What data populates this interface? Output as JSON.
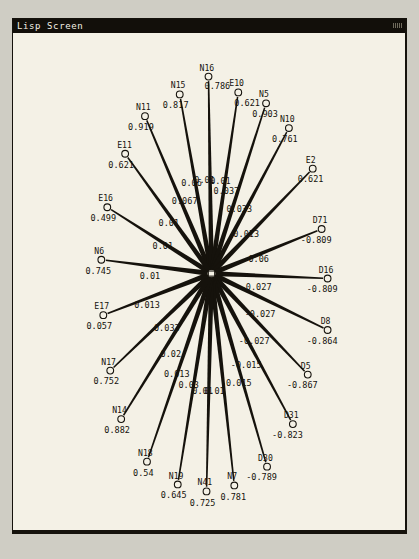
{
  "window": {
    "title": "Lisp Screen",
    "background_color": "#f4f1e6",
    "border_color": "#15120c",
    "desktop_color": "#cfcdc4"
  },
  "diagram": {
    "type": "radial-node-link-graph",
    "hub": {
      "name": "N13",
      "value": "0.89",
      "x": 213,
      "y": 276
    },
    "nodes": [
      {
        "name": "N11",
        "value": "0.919",
        "cx": 146,
        "cy": 117,
        "label_dx": -9,
        "label_dy": -6,
        "value_dx": -17,
        "value_dy": 14,
        "edge_label": "0.067",
        "edge_label_x": 186,
        "edge_label_y": 206
      },
      {
        "name": "N15",
        "value": "0.817",
        "cx": 181,
        "cy": 95,
        "label_dx": -9,
        "label_dy": -6,
        "value_dx": -17,
        "value_dy": 14,
        "edge_label": "0.06",
        "edge_label_x": 193,
        "edge_label_y": 188
      },
      {
        "name": "N16",
        "value": "0.786",
        "cx": 210,
        "cy": 77,
        "label_dx": -9,
        "label_dy": -6,
        "value_dx": -4,
        "value_dy": 13,
        "edge_label": "0.01",
        "edge_label_x": 206,
        "edge_label_y": 185
      },
      {
        "name": "E10",
        "value": "0.621",
        "cx": 240,
        "cy": 93,
        "label_dx": -9,
        "label_dy": -6,
        "value_dx": -4,
        "value_dy": 14,
        "edge_label": "0.01",
        "edge_label_x": 222,
        "edge_label_y": 186
      },
      {
        "name": "N5",
        "value": "0.903",
        "cx": 268,
        "cy": 104,
        "label_dx": -7,
        "label_dy": -6,
        "value_dx": -14,
        "value_dy": 14,
        "edge_label": "0.037",
        "edge_label_x": 228,
        "edge_label_y": 196
      },
      {
        "name": "N10",
        "value": "0.761",
        "cx": 291,
        "cy": 129,
        "label_dx": -9,
        "label_dy": -6,
        "value_dx": -17,
        "value_dy": 14,
        "edge_label": "0.033",
        "edge_label_x": 241,
        "edge_label_y": 214
      },
      {
        "name": "E2",
        "value": "0.621",
        "cx": 315,
        "cy": 170,
        "label_dx": -7,
        "label_dy": -6,
        "value_dx": -15,
        "value_dy": 14,
        "edge_label": "0.013",
        "edge_label_x": 248,
        "edge_label_y": 239
      },
      {
        "name": "D71",
        "value": "-0.809",
        "cx": 324,
        "cy": 231,
        "label_dx": -9,
        "label_dy": -6,
        "value_dx": -21,
        "value_dy": 14,
        "edge_label": "-0.06",
        "edge_label_x": 258,
        "edge_label_y": 264
      },
      {
        "name": "D16",
        "value": "-0.809",
        "cx": 330,
        "cy": 281,
        "label_dx": -9,
        "label_dy": -6,
        "value_dx": -21,
        "value_dy": 14,
        "edge_label": "-0.027",
        "edge_label_x": 258,
        "edge_label_y": 293
      },
      {
        "name": "D8",
        "value": "-0.864",
        "cx": 330,
        "cy": 333,
        "label_dx": -7,
        "label_dy": -6,
        "value_dx": -21,
        "value_dy": 14,
        "edge_label": "-0.027",
        "edge_label_x": 262,
        "edge_label_y": 320
      },
      {
        "name": "D5",
        "value": "-0.867",
        "cx": 310,
        "cy": 378,
        "label_dx": -7,
        "label_dy": -6,
        "value_dx": -21,
        "value_dy": 14,
        "edge_label": "-0.027",
        "edge_label_x": 256,
        "edge_label_y": 347
      },
      {
        "name": "D31",
        "value": "-0.823",
        "cx": 295,
        "cy": 428,
        "label_dx": -9,
        "label_dy": -6,
        "value_dx": -21,
        "value_dy": 14,
        "edge_label": "-0.015",
        "edge_label_x": 248,
        "edge_label_y": 371
      },
      {
        "name": "D30",
        "value": "-0.789",
        "cx": 269,
        "cy": 471,
        "label_dx": -9,
        "label_dy": -6,
        "value_dx": -21,
        "value_dy": 14,
        "edge_label": "-0.015",
        "edge_label_x": 238,
        "edge_label_y": 390
      },
      {
        "name": "N7",
        "value": "0.781",
        "cx": 236,
        "cy": 490,
        "label_dx": -7,
        "label_dy": -6,
        "value_dx": -14,
        "value_dy": 15,
        "edge_label": "0.01",
        "edge_label_x": 216,
        "edge_label_y": 398
      },
      {
        "name": "N41",
        "value": "0.725",
        "cx": 208,
        "cy": 496,
        "label_dx": -9,
        "label_dy": -6,
        "value_dx": -17,
        "value_dy": 15,
        "edge_label": "0.01",
        "edge_label_x": 204,
        "edge_label_y": 398
      },
      {
        "name": "N19",
        "value": "0.645",
        "cx": 179,
        "cy": 489,
        "label_dx": -9,
        "label_dy": -6,
        "value_dx": -17,
        "value_dy": 14,
        "edge_label": "0.03",
        "edge_label_x": 190,
        "edge_label_y": 392
      },
      {
        "name": "N18",
        "value": "0.54",
        "cx": 148,
        "cy": 466,
        "label_dx": -9,
        "label_dy": -6,
        "value_dx": -14,
        "value_dy": 14,
        "edge_label": "0.013",
        "edge_label_x": 178,
        "edge_label_y": 380
      },
      {
        "name": "N14",
        "value": "0.882",
        "cx": 122,
        "cy": 423,
        "label_dx": -9,
        "label_dy": -6,
        "value_dx": -17,
        "value_dy": 14,
        "edge_label": "0.02",
        "edge_label_x": 172,
        "edge_label_y": 360
      },
      {
        "name": "N17",
        "value": "0.752",
        "cx": 111,
        "cy": 374,
        "label_dx": -9,
        "label_dy": -6,
        "value_dx": -17,
        "value_dy": 14,
        "edge_label": "0.033",
        "edge_label_x": 168,
        "edge_label_y": 334
      },
      {
        "name": "E17",
        "value": "0.057",
        "cx": 104,
        "cy": 318,
        "label_dx": -9,
        "label_dy": -6,
        "value_dx": -17,
        "value_dy": 14,
        "edge_label": "0.013",
        "edge_label_x": 148,
        "edge_label_y": 311
      },
      {
        "name": "N6",
        "value": "0.745",
        "cx": 102,
        "cy": 262,
        "label_dx": -7,
        "label_dy": -6,
        "value_dx": -16,
        "value_dy": 14,
        "edge_label": "0.01",
        "edge_label_x": 151,
        "edge_label_y": 281
      },
      {
        "name": "E16",
        "value": "0.499",
        "cx": 108,
        "cy": 209,
        "label_dx": -9,
        "label_dy": -6,
        "value_dx": -17,
        "value_dy": 14,
        "edge_label": "0.01",
        "edge_label_x": 164,
        "edge_label_y": 251
      },
      {
        "name": "E11",
        "value": "0.621",
        "cx": 126,
        "cy": 155,
        "label_dx": -8,
        "label_dy": -6,
        "value_dx": -17,
        "value_dy": 14,
        "edge_label": "0.01",
        "edge_label_x": 170,
        "edge_label_y": 228
      }
    ]
  }
}
